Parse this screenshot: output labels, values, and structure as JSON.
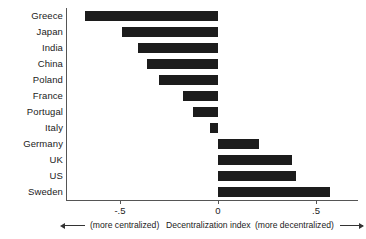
{
  "chart_data": {
    "type": "bar",
    "orientation": "horizontal",
    "title": "",
    "xlabel": "Decentralization index",
    "ylabel": "",
    "xlim": [
      -0.75,
      0.62
    ],
    "grid": false,
    "legend": null,
    "categories": [
      "Greece",
      "Japan",
      "India",
      "China",
      "Poland",
      "France",
      "Portugal",
      "Italy",
      "Germany",
      "UK",
      "US",
      "Sweden"
    ],
    "values": [
      -0.68,
      -0.49,
      -0.41,
      -0.36,
      -0.3,
      -0.18,
      -0.13,
      -0.04,
      0.21,
      0.38,
      0.4,
      0.57
    ],
    "xticks": [
      -0.5,
      0,
      0.5
    ],
    "xtick_labels": [
      "-.5",
      "0",
      ".5"
    ],
    "bar_color": "#1c1c1c",
    "axis_color": "#555555"
  },
  "caption": {
    "left_note": "(more centralized)",
    "center_note": "Decentralization index",
    "right_note": "(more decentralized)",
    "left_arrow_icon": "arrow-left-icon",
    "right_arrow_icon": "arrow-right-icon"
  }
}
